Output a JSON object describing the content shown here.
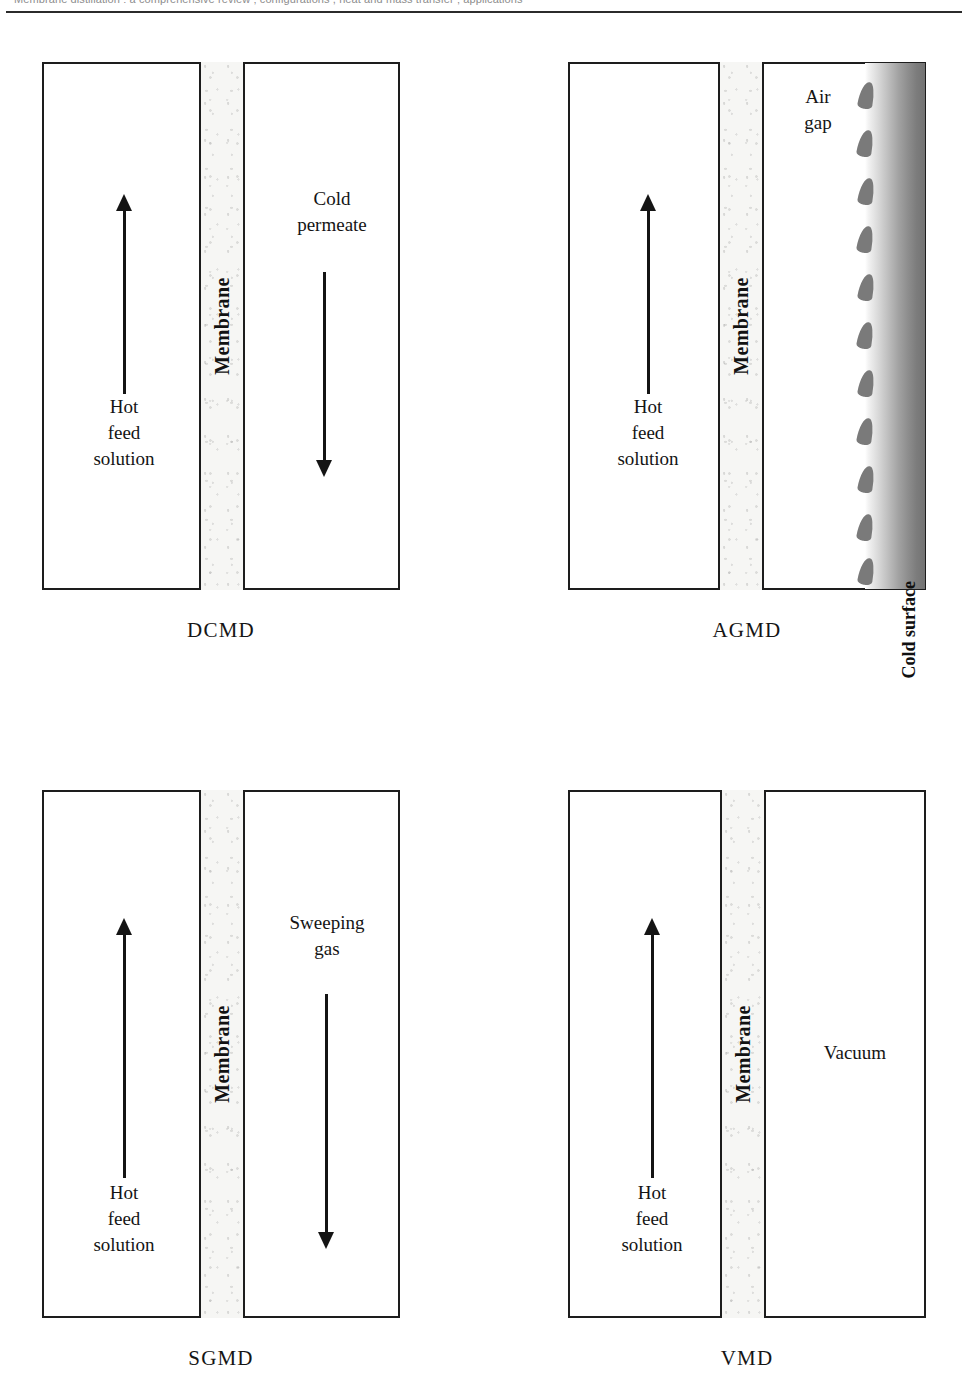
{
  "page": {
    "running_head": "Membrane distillation : a comprehensive review ; configurations , heat and mass transfer ; applications",
    "width": 968,
    "height": 1387
  },
  "figure": {
    "membrane_label": "Membrane",
    "panels": [
      {
        "id": "dcmd",
        "caption": "DCMD",
        "feed_label": "Hot\nfeed\nsolution",
        "feed_arrow": "up",
        "permeate_label": "Cold\npermeate",
        "permeate_arrow": "down",
        "has_air_gap": false,
        "has_cold_surface": false
      },
      {
        "id": "agmd",
        "caption": "AGMD",
        "feed_label": "Hot\nfeed\nsolution",
        "feed_arrow": "up",
        "permeate_label": "Air\ngap",
        "permeate_arrow": "none",
        "has_air_gap": true,
        "has_cold_surface": true,
        "cold_surface_label": "Cold surface",
        "droplet_count": 11
      },
      {
        "id": "sgmd",
        "caption": "SGMD",
        "feed_label": "Hot\nfeed\nsolution",
        "feed_arrow": "up",
        "permeate_label": "Sweeping\ngas",
        "permeate_arrow": "down",
        "has_air_gap": false,
        "has_cold_surface": false
      },
      {
        "id": "vmd",
        "caption": "VMD",
        "feed_label": "Hot\nfeed\nsolution",
        "feed_arrow": "up",
        "permeate_label": "Vacuum",
        "permeate_arrow": "none",
        "has_air_gap": false,
        "has_cold_surface": false
      }
    ]
  },
  "colors": {
    "ink": "#1d1d1d",
    "membrane_fill": "#f6f6f4",
    "droplet": "#7a7a7a",
    "cold_surface_dark": "#737373",
    "paper": "#ffffff"
  }
}
